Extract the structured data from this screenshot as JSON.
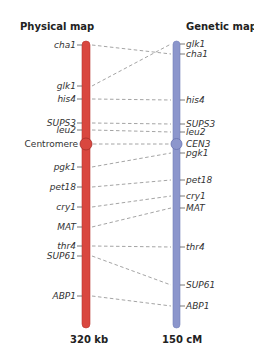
{
  "titles": {
    "physical": "Physical map",
    "genetic": "Genetic map"
  },
  "scales": {
    "physical": "320 kb",
    "genetic": "150 cM"
  },
  "colors": {
    "physical_bar": "#d9473f",
    "genetic_bar": "#8c96cc",
    "connector": "#9a9a9a"
  },
  "markers": [
    {
      "name": "cha1",
      "physical_y": 45,
      "genetic_y": 54,
      "physical_label": "cha1",
      "genetic_label": "cha1"
    },
    {
      "name": "glk1",
      "physical_y": 86,
      "genetic_y": 44,
      "physical_label": "glk1",
      "genetic_label": "glk1"
    },
    {
      "name": "his4",
      "physical_y": 99,
      "genetic_y": 100,
      "physical_label": "his4",
      "genetic_label": "his4"
    },
    {
      "name": "SUPS3",
      "physical_y": 123,
      "genetic_y": 124,
      "physical_label": "SUPS3",
      "genetic_label": "SUPS3"
    },
    {
      "name": "leu2",
      "physical_y": 130,
      "genetic_y": 132,
      "physical_label": "leu2",
      "genetic_label": "leu2"
    },
    {
      "name": "CEN3",
      "physical_y": 144,
      "genetic_y": 144,
      "physical_label": "Centromere",
      "genetic_label": "CEN3"
    },
    {
      "name": "pgk1",
      "physical_y": 167,
      "genetic_y": 153,
      "physical_label": "pgk1",
      "genetic_label": "pgk1"
    },
    {
      "name": "pet18",
      "physical_y": 187,
      "genetic_y": 180,
      "physical_label": "pet18",
      "genetic_label": "pet18"
    },
    {
      "name": "cry1",
      "physical_y": 207,
      "genetic_y": 196,
      "physical_label": "cry1",
      "genetic_label": "cry1"
    },
    {
      "name": "MAT",
      "physical_y": 227,
      "genetic_y": 208,
      "physical_label": "MAT",
      "genetic_label": "MAT"
    },
    {
      "name": "thr4",
      "physical_y": 246,
      "genetic_y": 247,
      "physical_label": "thr4",
      "genetic_label": "thr4"
    },
    {
      "name": "SUP61",
      "physical_y": 256,
      "genetic_y": 285,
      "physical_label": "SUP61",
      "genetic_label": "SUP61"
    },
    {
      "name": "ABP1",
      "physical_y": 296,
      "genetic_y": 306,
      "physical_label": "ABP1",
      "genetic_label": "ABP1"
    }
  ]
}
